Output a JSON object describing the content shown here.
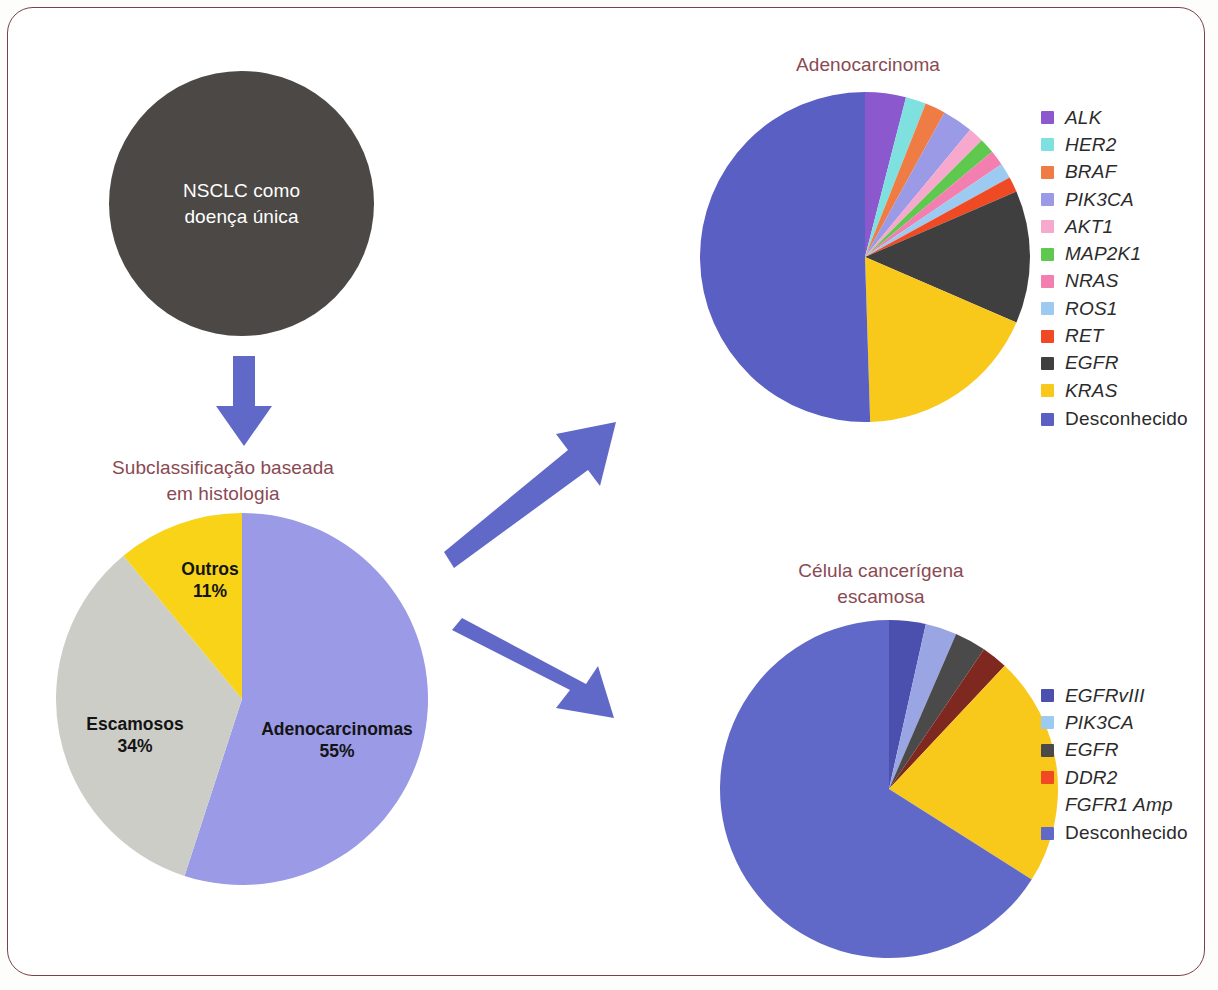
{
  "frame": {
    "border_color": "#7d4049"
  },
  "source_node": {
    "label": "NSCLC como\ndoença única",
    "line1": "NSCLC como",
    "line2": "doença única",
    "fill": "#4b4845",
    "text_color": "#ffffff"
  },
  "arrows": {
    "color": "#6169c8",
    "down": "arrow-down",
    "up_right": "arrow-up-right",
    "down_right": "arrow-down-right"
  },
  "titles": {
    "histology_line1": "Subclassificação baseada",
    "histology_line2": "em histologia",
    "adeno": "Adenocarcinoma",
    "squamous_line1": "Célula cancerígena",
    "squamous_line2": "escamosa",
    "color": "#8a4a53"
  },
  "chart_data": [
    {
      "type": "pie",
      "name": "histology",
      "title": "Subclassificação baseada em histologia",
      "legend": "in-slice labels",
      "categories": [
        "Adenocarcinomas",
        "Escamosos",
        "Outros"
      ],
      "values": [
        55,
        34,
        11
      ],
      "value_labels": [
        "55%",
        "34%",
        "11%"
      ],
      "colors": [
        "#9a9ae6",
        "#cdcdc8",
        "#f8d318"
      ],
      "start_angle_deg": 0,
      "direction": "clockwise"
    },
    {
      "type": "pie",
      "name": "adenocarcinoma",
      "title": "Adenocarcinoma",
      "legend_position": "right",
      "categories": [
        "ALK",
        "HER2",
        "BRAF",
        "PIK3CA",
        "AKT1",
        "MAP2K1",
        "NRAS",
        "ROS1",
        "RET",
        "EGFR",
        "KRAS",
        "Desconhecido"
      ],
      "values": [
        4,
        2,
        2,
        3,
        1.5,
        1.5,
        1.5,
        1.5,
        1.5,
        13,
        18,
        50.5
      ],
      "colors": [
        "#8b58cd",
        "#7fe0e0",
        "#ef7b45",
        "#9a9ae6",
        "#f6a8cd",
        "#5fc94f",
        "#f27fb0",
        "#9dcaf0",
        "#f04a25",
        "#3f3f3f",
        "#f8c81b",
        "#5a5fc4"
      ],
      "start_angle_deg": 0,
      "direction": "clockwise"
    },
    {
      "type": "pie",
      "name": "squamous",
      "title": "Célula cancerígena escamosa",
      "legend_position": "right",
      "categories": [
        "EGFRvIII",
        "PIK3CA",
        "EGFR",
        "DDR2",
        "FGFR1 Amp",
        "Desconhecido"
      ],
      "values": [
        3.5,
        3.0,
        3.0,
        2.5,
        22.0,
        66.0
      ],
      "colors": [
        "#4b4fae",
        "#9aa5e3",
        "#4a4a4a",
        "#7e2820",
        "#f8c81b",
        "#6169c8"
      ],
      "start_angle_deg": 0,
      "direction": "clockwise"
    }
  ],
  "histology_labels": [
    {
      "name": "Adenocarcinomas",
      "pct": "55%"
    },
    {
      "name": "Escamosos",
      "pct": "34%"
    },
    {
      "name": "Outros",
      "pct": "11%"
    }
  ],
  "adeno_legend": [
    {
      "label": "ALK",
      "color": "#8b58cd",
      "italic": true
    },
    {
      "label": "HER2",
      "color": "#7fe0e0",
      "italic": true
    },
    {
      "label": "BRAF",
      "color": "#ef7b45",
      "italic": true
    },
    {
      "label": "PIK3CA",
      "color": "#9a9ae6",
      "italic": true
    },
    {
      "label": "AKT1",
      "color": "#f6a8cd",
      "italic": true
    },
    {
      "label": "MAP2K1",
      "color": "#5fc94f",
      "italic": true
    },
    {
      "label": "NRAS",
      "color": "#f27fb0",
      "italic": true
    },
    {
      "label": "ROS1",
      "color": "#9dcaf0",
      "italic": true
    },
    {
      "label": "RET",
      "color": "#f04a25",
      "italic": true
    },
    {
      "label": "EGFR",
      "color": "#3f3f3f",
      "italic": true
    },
    {
      "label": "KRAS",
      "color": "#f8c81b",
      "italic": true
    },
    {
      "label": "Desconhecido",
      "color": "#5a5fc4",
      "italic": false
    }
  ],
  "squamous_legend": [
    {
      "label": "EGFRvIII",
      "color": "#4b4fae",
      "italic": true
    },
    {
      "label": "PIK3CA",
      "color": "#9dcaf0",
      "italic": true
    },
    {
      "label": "EGFR",
      "color": "#4a4a4a",
      "italic": true
    },
    {
      "label": "DDR2",
      "color": "#f04a25",
      "italic": true
    },
    {
      "label": "FGFR1 Amp",
      "color": "#f8c81b",
      "italic": true
    },
    {
      "label": "Desconhecido",
      "color": "#6169c8",
      "italic": false
    }
  ]
}
